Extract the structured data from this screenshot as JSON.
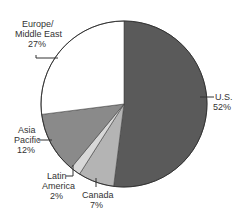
{
  "chart_data": {
    "type": "pie",
    "title": "",
    "categories": [
      "U.S.",
      "Canada",
      "Latin America",
      "Asia Pacific",
      "Europe/Middle East"
    ],
    "values": [
      52,
      7,
      2,
      12,
      27
    ],
    "unit": "%",
    "colors": [
      "#5a5a5a",
      "#b4b4b4",
      "#d8d8d8",
      "#8a8a8a",
      "#ffffff"
    ],
    "labels": [
      {
        "lines": [
          "U.S.",
          "52%"
        ]
      },
      {
        "lines": [
          "Canada",
          "7%"
        ]
      },
      {
        "lines": [
          "Latin",
          "America",
          "2%"
        ]
      },
      {
        "lines": [
          "Asia",
          "Pacific",
          "12%"
        ]
      },
      {
        "lines": [
          "Europe/",
          "Middle East",
          "27%"
        ]
      }
    ],
    "legend": "none (callout labels)"
  }
}
